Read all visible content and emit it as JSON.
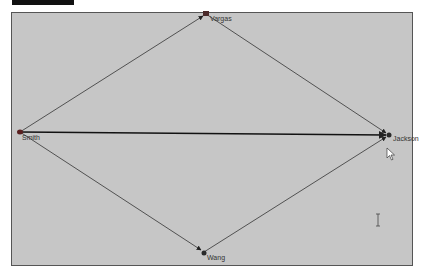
{
  "diagram": {
    "type": "directed-graph",
    "nodes": [
      {
        "id": "vargas",
        "label": "Vargas",
        "x": 206,
        "y": 14
      },
      {
        "id": "smith",
        "label": "Smith",
        "x": 20,
        "y": 132
      },
      {
        "id": "jackson",
        "label": "Jackson",
        "x": 389,
        "y": 135
      },
      {
        "id": "wang",
        "label": "Wang",
        "x": 204,
        "y": 252
      }
    ],
    "edges": [
      {
        "from": "smith",
        "to": "vargas"
      },
      {
        "from": "vargas",
        "to": "jackson"
      },
      {
        "from": "smith",
        "to": "jackson"
      },
      {
        "from": "smith",
        "to": "wang"
      },
      {
        "from": "wang",
        "to": "jackson"
      }
    ]
  },
  "colors": {
    "canvas_bg": "#c6c6c6",
    "edge": "#333333",
    "node": "#5a2a2a",
    "border": "#555555"
  },
  "cursors": {
    "pointer": {
      "x": 387,
      "y": 150
    },
    "text_ibeam": {
      "x": 378,
      "y": 220
    }
  }
}
